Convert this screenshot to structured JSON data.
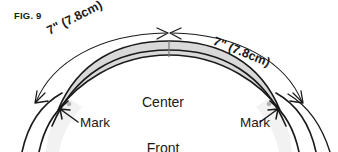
{
  "figure": {
    "label": "FIG. 9",
    "background_color": "#ffffff",
    "ink_color": "#1a1a1a",
    "band_fill_color": "#d9d9d9",
    "panel_fill_color": "#f2f2f2",
    "mark_dot_color": "#b3b3b3"
  },
  "measurements": {
    "left": "7\" (7.8cm)",
    "right": "7\" (7.8cm)"
  },
  "annotations": {
    "center_front_line1": "Center",
    "center_front_line2": "Front",
    "mark_left": "Mark",
    "mark_right": "Mark"
  },
  "icons": {
    "arrow_left_end": "arrow-left-icon",
    "arrow_right_end": "arrow-right-icon",
    "arrow_center_left": "arrowhead-right-icon",
    "arrow_center_right": "arrowhead-left-icon",
    "pointer_mark_left": "pointer-arrow-icon",
    "pointer_mark_right": "pointer-arrow-icon",
    "center_tick": "tick-mark-icon",
    "mark_dot_left": "dot-icon",
    "mark_dot_right": "dot-icon"
  }
}
